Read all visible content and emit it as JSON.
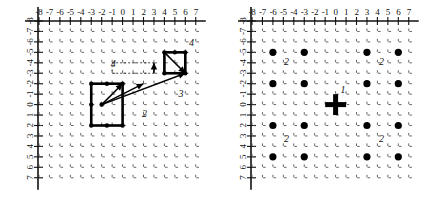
{
  "figure": {
    "type": "two-panel-lattice-diagram",
    "panel_count": 2
  },
  "axes": {
    "x_ticks": [
      "-8",
      "-7",
      "-6",
      "-5",
      "-4",
      "-3",
      "-2",
      "-1",
      "0",
      "1",
      "2",
      "3",
      "4",
      "5",
      "6",
      "7"
    ],
    "y_ticks": [
      "-8",
      "-7",
      "-6",
      "-5",
      "-4",
      "-3",
      "-2",
      "-1",
      "0",
      "1",
      "2",
      "3",
      "4",
      "5",
      "6",
      "7"
    ],
    "x_min": -8,
    "x_max": 7,
    "y_min": -8,
    "y_max": 7,
    "x_axis_position": "top",
    "y_axis_position": "left",
    "y_axis_direction": "downward-increasing",
    "grid": "dotted-tick-lattice"
  },
  "chart_data": {
    "type": "scatter",
    "title": "",
    "xlabel": "",
    "ylabel": "",
    "xlim": [
      -8,
      7
    ],
    "ylim": [
      -8,
      7
    ],
    "grid": true,
    "legend": "none",
    "panels": [
      {
        "id": "left",
        "name": "left-panel",
        "squares": [
          {
            "label": "big-square",
            "x0": -3,
            "y0": -2,
            "x1": 0,
            "y1": 2,
            "corner_nodes": [
              [
                -3,
                -2
              ],
              [
                0,
                -2
              ],
              [
                0,
                2
              ],
              [
                -3,
                2
              ],
              [
                -3,
                0
              ],
              [
                -1.5,
                -2
              ],
              [
                -1.5,
                2
              ]
            ]
          },
          {
            "label": "small-square",
            "x0": 4,
            "y0": -5,
            "x1": 6,
            "y1": -3,
            "corner_nodes": [
              [
                4,
                -5
              ],
              [
                6,
                -5
              ],
              [
                6,
                -3
              ],
              [
                4,
                -3
              ],
              [
                5,
                -5
              ]
            ]
          }
        ],
        "dashed_rects": [
          {
            "label": "dashed-guide-rect",
            "x0": -1,
            "y0": -4,
            "x1": 3,
            "y1": -3
          }
        ],
        "arrows": [
          {
            "label": "arrow-to-square-corner",
            "from": [
              -2,
              0
            ],
            "to": [
              0,
              -2
            ]
          },
          {
            "label": "arrow-to-mid-right",
            "from": [
              -2,
              0
            ],
            "to": [
              2,
              -2
            ]
          },
          {
            "label": "arrow-to-small-square",
            "from": [
              -2,
              0
            ],
            "to": [
              6,
              -3
            ]
          },
          {
            "label": "arrow-inner-small-square",
            "from": [
              4,
              -5
            ],
            "to": [
              6,
              -3
            ]
          },
          {
            "label": "arrow-up-guide",
            "from": [
              3,
              -3
            ],
            "to": [
              3,
              -4
            ]
          }
        ],
        "annotations": [
          {
            "text": "4",
            "x": 6.6,
            "y": -5.6
          },
          {
            "text": "3",
            "x": 5.6,
            "y": -0.7
          },
          {
            "text": "2",
            "x": 2.1,
            "y": 1.2
          },
          {
            "text": "4",
            "x": -0.9,
            "y": -3.6
          }
        ]
      },
      {
        "id": "right",
        "name": "right-panel",
        "dots": [
          [
            -6,
            -5
          ],
          [
            -3,
            -5
          ],
          [
            3,
            -5
          ],
          [
            6,
            -5
          ],
          [
            -6,
            -2
          ],
          [
            -3,
            -2
          ],
          [
            3,
            -2
          ],
          [
            6,
            -2
          ],
          [
            -6,
            2
          ],
          [
            -3,
            2
          ],
          [
            3,
            2
          ],
          [
            6,
            2
          ],
          [
            -6,
            5
          ],
          [
            -3,
            5
          ],
          [
            3,
            5
          ],
          [
            6,
            5
          ]
        ],
        "cross": {
          "label": "origin-cross",
          "x": 0,
          "y": 0,
          "arm": 1
        },
        "annotations": [
          {
            "text": "2",
            "x": -4.7,
            "y": -3.8
          },
          {
            "text": "2",
            "x": 4.4,
            "y": -3.8
          },
          {
            "text": "1",
            "x": 0.7,
            "y": -1.1
          },
          {
            "text": "2",
            "x": -4.7,
            "y": 3.6
          },
          {
            "text": "2",
            "x": 4.4,
            "y": 3.6
          }
        ]
      }
    ]
  },
  "colors": {
    "ink": "#000000",
    "grid": "#4a4a4a",
    "background": "#ffffff"
  }
}
